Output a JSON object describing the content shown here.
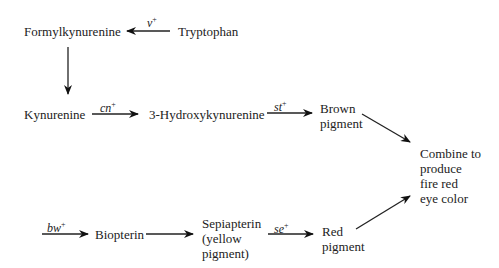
{
  "diagram": {
    "type": "pathway",
    "title": "",
    "nodes": {
      "tryptophan": "Tryptophan",
      "formylkynurenine": "Formylkynurenine",
      "kynurenine": "Kynurenine",
      "hydroxykynurenine": "3-Hydroxykynurenine",
      "brown_pigment": [
        "Brown",
        "pigment"
      ],
      "combine": [
        "Combine to",
        "produce",
        "fire red",
        "eye color"
      ],
      "biopterin": "Biopterin",
      "sepiapterin": [
        "Sepiapterin",
        "(yellow",
        "pigment)"
      ],
      "red_pigment": [
        "Red",
        "pigment"
      ]
    },
    "genes": {
      "v": {
        "name": "v",
        "sup": "+"
      },
      "cn": {
        "name": "cn",
        "sup": "+"
      },
      "st": {
        "name": "st",
        "sup": "+"
      },
      "bw": {
        "name": "bw",
        "sup": "+"
      },
      "se": {
        "name": "se",
        "sup": "+"
      }
    },
    "edges": [
      {
        "from": "Tryptophan",
        "to": "Formylkynurenine",
        "gene": "v+"
      },
      {
        "from": "Formylkynurenine",
        "to": "Kynurenine",
        "gene": ""
      },
      {
        "from": "Kynurenine",
        "to": "3-Hydroxykynurenine",
        "gene": "cn+"
      },
      {
        "from": "3-Hydroxykynurenine",
        "to": "Brown pigment",
        "gene": "st+"
      },
      {
        "from": "Brown pigment",
        "to": "Combine to produce fire red eye color",
        "gene": ""
      },
      {
        "from": "(start)",
        "to": "Biopterin",
        "gene": "bw+"
      },
      {
        "from": "Biopterin",
        "to": "Sepiapterin (yellow pigment)",
        "gene": ""
      },
      {
        "from": "Sepiapterin (yellow pigment)",
        "to": "Red pigment",
        "gene": "se+"
      },
      {
        "from": "Red pigment",
        "to": "Combine to produce fire red eye color",
        "gene": ""
      }
    ],
    "colors": {
      "ink": "#222222",
      "background": "#ffffff"
    }
  }
}
